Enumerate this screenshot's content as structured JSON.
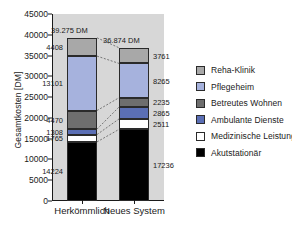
{
  "chart_data": {
    "type": "bar",
    "subtype": "stacked-vertical",
    "title": "",
    "xlabel": "",
    "ylabel": "Gesamtkosten [DM]",
    "ylim": [
      0,
      45000
    ],
    "yticks": [
      0,
      5000,
      10000,
      15000,
      20000,
      25000,
      30000,
      35000,
      40000,
      45000
    ],
    "ytick_labels": [
      "0",
      "5000",
      "10000",
      "15000",
      "20000",
      "25000",
      "30000",
      "35000",
      "40000",
      "45000"
    ],
    "grid": false,
    "legend_position": "right",
    "currency": "DM",
    "categories": [
      "Herkömmlich",
      "Neues System"
    ],
    "totals": [
      39275,
      36874
    ],
    "total_labels": [
      "39.275 DM",
      "36.874 DM"
    ],
    "series": [
      {
        "name": "Reha-Klinik",
        "color": "#a8a8a8",
        "values": [
          4408,
          3761
        ]
      },
      {
        "name": "Pflegeheim",
        "color": "#a6b2dd",
        "values": [
          13101,
          8265
        ]
      },
      {
        "name": "Betreutes Wohnen",
        "color": "#6e6e6e",
        "values": [
          4470,
          2235
        ]
      },
      {
        "name": "Ambulante Dienste",
        "color": "#5b6fb5",
        "values": [
          1308,
          2865
        ]
      },
      {
        "name": "Medizinische Leistung",
        "color": "#ffffff",
        "values": [
          1765,
          2511
        ]
      },
      {
        "name": "Akutstationär",
        "color": "#000000",
        "values": [
          14224,
          17236
        ]
      }
    ],
    "stack_order_top_to_bottom": [
      "Reha-Klinik",
      "Pflegeheim",
      "Betreutes Wohnen",
      "Ambulante Dienste",
      "Medizinische Leistung",
      "Akutstationär"
    ],
    "value_labels": {
      "Herkömmlich": [
        "4408",
        "13101",
        "4470",
        "1308",
        "1765",
        "14224"
      ],
      "Neues System": [
        "3761",
        "8265",
        "2235",
        "2865",
        "2511",
        "17236"
      ]
    },
    "connectors": "dashed lines linking matching segment boundaries between the two bars",
    "plot_background": "#d7d7d7",
    "figure_background": "#ffffff"
  },
  "legend": {
    "items": [
      {
        "label": "Reha-Klinik"
      },
      {
        "label": "Pflegeheim"
      },
      {
        "label": "Betreutes Wohnen"
      },
      {
        "label": "Ambulante Dienste"
      },
      {
        "label": "Medizinische Leistung"
      },
      {
        "label": "Akutstationär"
      }
    ]
  }
}
